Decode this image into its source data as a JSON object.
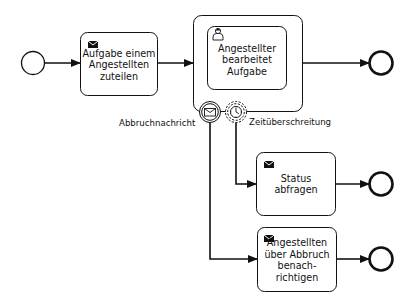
{
  "diagram": {
    "type": "BPMN process",
    "start_event": {
      "name": "start-event",
      "label": ""
    },
    "tasks": [
      {
        "id": "t1",
        "label": "Aufgabe einem\nAngestellten\nzuteilen",
        "marker": "envelope-icon"
      },
      {
        "id": "t2",
        "label": "Angestellter\nbearbeitet\nAufgabe",
        "marker": "user-icon"
      },
      {
        "id": "t3",
        "label": "Status\nabfragen",
        "marker": "envelope-icon"
      },
      {
        "id": "t4",
        "label": "Angestellten\nüber Abbruch\nbenach-\nrichtigen",
        "marker": "envelope-icon"
      }
    ],
    "subprocess": {
      "id": "sp1",
      "contains": "t2"
    },
    "boundary_events": [
      {
        "id": "b1",
        "type": "message (interrupting)",
        "label": "Abbruchnachricht",
        "attached_to": "sp1"
      },
      {
        "id": "b2",
        "type": "timer (non-interrupting)",
        "label": "Zeitüberschreitung",
        "attached_to": "sp1"
      }
    ],
    "end_events": [
      {
        "id": "e1",
        "after": "sp1"
      },
      {
        "id": "e2",
        "after": "t3"
      },
      {
        "id": "e3",
        "after": "t4"
      }
    ],
    "flows": [
      {
        "from": "start",
        "to": "t1"
      },
      {
        "from": "t1",
        "to": "sp1"
      },
      {
        "from": "sp1",
        "to": "e1"
      },
      {
        "from": "b2",
        "to": "t3"
      },
      {
        "from": "t3",
        "to": "e2"
      },
      {
        "from": "b1",
        "to": "t4"
      },
      {
        "from": "t4",
        "to": "e3"
      }
    ],
    "colors": {
      "stroke": "#111111",
      "fill": "#ffffff"
    }
  }
}
